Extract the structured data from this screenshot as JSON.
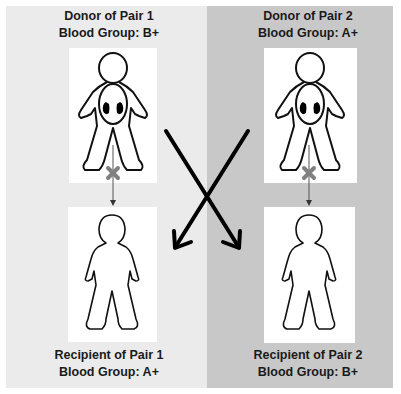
{
  "diagram": {
    "pairs": [
      {
        "donor": {
          "title": "Donor of Pair 1",
          "blood_group": "Blood Group: B+"
        },
        "recipient": {
          "title": "Recipient of Pair 1",
          "blood_group": "Blood Group: A+"
        },
        "direct_transplant": "incompatible"
      },
      {
        "donor": {
          "title": "Donor of Pair 2",
          "blood_group": "Blood Group: A+"
        },
        "recipient": {
          "title": "Recipient of Pair 2",
          "blood_group": "Blood Group: B+"
        },
        "direct_transplant": "incompatible"
      }
    ],
    "cross_exchange": [
      {
        "from": "Donor of Pair 1",
        "to": "Recipient of Pair 2"
      },
      {
        "from": "Donor of Pair 2",
        "to": "Recipient of Pair 1"
      }
    ],
    "icons": {
      "blocked": "x-mark-icon",
      "donor_figure": "person-with-kidneys-icon",
      "recipient_figure": "person-outline-icon"
    },
    "colors": {
      "left_panel": "#ebebeb",
      "right_panel": "#c8c8c8",
      "x_mark": "#808080",
      "arrows": "#000000"
    }
  }
}
